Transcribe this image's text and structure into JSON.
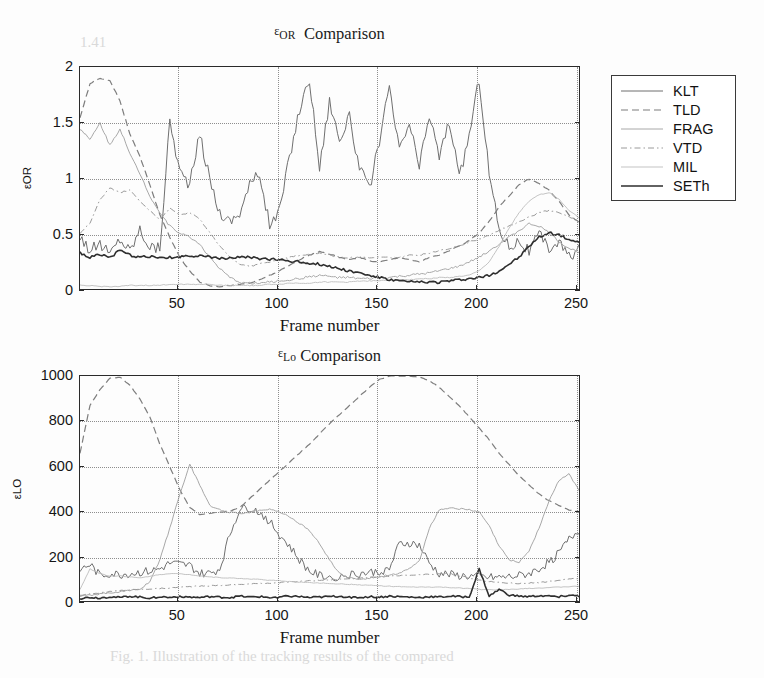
{
  "figures": [
    {
      "id": "top",
      "title_eps": "ε",
      "title_sub": "OR",
      "title_rest": "Comparison",
      "ylabel_eps": "ε",
      "ylabel_sub": "OR",
      "xlabel": "Frame number",
      "yticks": [
        "0",
        "0.5",
        "1",
        "1.5",
        "2"
      ],
      "xticks": [
        "50",
        "100",
        "150",
        "200",
        "250"
      ]
    },
    {
      "id": "bottom",
      "title_eps": "ε",
      "title_sub": "Lo",
      "title_rest": "Comparison",
      "ylabel_eps": "ε",
      "ylabel_sub": "LO",
      "xlabel": "Frame number",
      "yticks": [
        "0",
        "200",
        "400",
        "600",
        "800",
        "1000"
      ],
      "xticks": [
        "50",
        "100",
        "150",
        "200",
        "250"
      ]
    }
  ],
  "legend": {
    "entries": [
      {
        "label": "KLT",
        "color": "#6f6f6f",
        "width": 1.0,
        "dash": "none"
      },
      {
        "label": "TLD",
        "color": "#7d7d7d",
        "width": 1.2,
        "dash": "7,4"
      },
      {
        "label": "FRAG",
        "color": "#a8a8a8",
        "width": 1.0,
        "dash": "none"
      },
      {
        "label": "VTD",
        "color": "#9a9a9a",
        "width": 1.0,
        "dash": "6,3,1.5,3"
      },
      {
        "label": "MIL",
        "color": "#bcbcbc",
        "width": 0.9,
        "dash": "none"
      },
      {
        "label": "SETh",
        "color": "#2e2e2e",
        "width": 1.6,
        "dash": "none"
      }
    ]
  },
  "bleed_text": [
    {
      "text": "Fig. 1. Illustration of the tracking results of the compared",
      "left": 110,
      "top": 648
    },
    {
      "text": "1.41",
      "left": 80,
      "top": 34
    }
  ],
  "chart_data": [
    {
      "type": "line",
      "title": "ε_OR Comparison",
      "xlabel": "Frame number",
      "ylabel": "ε_OR",
      "xlim": [
        1,
        252
      ],
      "ylim": [
        0,
        2
      ],
      "grid": true,
      "legend_position": "outside-right",
      "x": [
        1,
        6,
        11,
        16,
        21,
        26,
        31,
        36,
        41,
        46,
        51,
        56,
        61,
        66,
        71,
        76,
        81,
        86,
        91,
        96,
        101,
        106,
        111,
        116,
        121,
        126,
        131,
        136,
        141,
        146,
        151,
        156,
        161,
        166,
        171,
        176,
        181,
        186,
        191,
        196,
        201,
        206,
        211,
        216,
        221,
        226,
        231,
        236,
        241,
        246,
        252
      ],
      "series": [
        {
          "name": "KLT",
          "values": [
            0.5,
            0.36,
            0.42,
            0.33,
            0.47,
            0.36,
            0.55,
            0.4,
            0.38,
            1.52,
            1.07,
            0.95,
            1.4,
            1.0,
            0.7,
            0.62,
            0.7,
            0.95,
            1.05,
            0.58,
            0.72,
            1.2,
            1.62,
            1.9,
            1.1,
            1.7,
            1.35,
            1.55,
            1.1,
            0.9,
            1.35,
            1.8,
            1.25,
            1.5,
            1.1,
            1.58,
            1.2,
            1.52,
            1.0,
            1.4,
            1.9,
            1.05,
            0.55,
            0.4,
            0.45,
            0.35,
            0.5,
            0.38,
            0.44,
            0.3,
            0.4
          ]
        },
        {
          "name": "TLD",
          "values": [
            1.55,
            1.85,
            1.9,
            1.88,
            1.7,
            1.4,
            1.2,
            0.95,
            0.68,
            0.48,
            0.3,
            0.18,
            0.08,
            0.05,
            0.04,
            0.05,
            0.06,
            0.07,
            0.1,
            0.14,
            0.18,
            0.23,
            0.28,
            0.32,
            0.35,
            0.33,
            0.3,
            0.28,
            0.3,
            0.27,
            0.26,
            0.28,
            0.3,
            0.28,
            0.26,
            0.3,
            0.32,
            0.36,
            0.4,
            0.45,
            0.52,
            0.62,
            0.75,
            0.85,
            0.95,
            1.0,
            0.96,
            0.9,
            0.8,
            0.68,
            0.6
          ]
        },
        {
          "name": "FRAG",
          "values": [
            1.45,
            1.35,
            1.5,
            1.3,
            1.45,
            1.22,
            1.05,
            0.85,
            0.7,
            0.58,
            0.52,
            0.48,
            0.42,
            0.3,
            0.2,
            0.12,
            0.08,
            0.07,
            0.07,
            0.08,
            0.09,
            0.1,
            0.11,
            0.13,
            0.14,
            0.13,
            0.12,
            0.12,
            0.11,
            0.11,
            0.12,
            0.12,
            0.13,
            0.14,
            0.15,
            0.16,
            0.18,
            0.2,
            0.22,
            0.26,
            0.3,
            0.36,
            0.42,
            0.48,
            0.54,
            0.6,
            0.58,
            0.52,
            0.44,
            0.38,
            0.34
          ]
        },
        {
          "name": "VTD",
          "values": [
            0.52,
            0.6,
            0.82,
            0.92,
            0.88,
            0.9,
            0.8,
            0.72,
            0.64,
            0.74,
            0.68,
            0.7,
            0.64,
            0.52,
            0.4,
            0.3,
            0.24,
            0.22,
            0.24,
            0.26,
            0.28,
            0.3,
            0.32,
            0.33,
            0.34,
            0.32,
            0.3,
            0.3,
            0.3,
            0.3,
            0.3,
            0.3,
            0.3,
            0.32,
            0.32,
            0.34,
            0.36,
            0.38,
            0.4,
            0.44,
            0.46,
            0.5,
            0.54,
            0.58,
            0.62,
            0.66,
            0.7,
            0.72,
            0.7,
            0.66,
            0.62
          ]
        },
        {
          "name": "MIL",
          "values": [
            0.05,
            0.05,
            0.04,
            0.04,
            0.04,
            0.05,
            0.05,
            0.05,
            0.05,
            0.06,
            0.06,
            0.06,
            0.06,
            0.06,
            0.05,
            0.05,
            0.05,
            0.05,
            0.05,
            0.06,
            0.06,
            0.07,
            0.07,
            0.07,
            0.08,
            0.08,
            0.08,
            0.08,
            0.09,
            0.09,
            0.09,
            0.1,
            0.1,
            0.1,
            0.11,
            0.11,
            0.12,
            0.12,
            0.13,
            0.14,
            0.18,
            0.26,
            0.4,
            0.56,
            0.7,
            0.8,
            0.86,
            0.88,
            0.82,
            0.72,
            0.64
          ]
        },
        {
          "name": "SETh",
          "values": [
            0.34,
            0.3,
            0.33,
            0.3,
            0.36,
            0.32,
            0.3,
            0.31,
            0.29,
            0.3,
            0.3,
            0.31,
            0.32,
            0.3,
            0.29,
            0.3,
            0.3,
            0.3,
            0.29,
            0.28,
            0.28,
            0.27,
            0.26,
            0.25,
            0.24,
            0.22,
            0.2,
            0.18,
            0.16,
            0.14,
            0.12,
            0.1,
            0.09,
            0.08,
            0.08,
            0.08,
            0.08,
            0.09,
            0.1,
            0.11,
            0.12,
            0.14,
            0.18,
            0.24,
            0.3,
            0.4,
            0.48,
            0.52,
            0.5,
            0.46,
            0.42
          ]
        }
      ]
    },
    {
      "type": "line",
      "title": "ε_Lo Comparison",
      "xlabel": "Frame number",
      "ylabel": "ε_LO",
      "xlim": [
        1,
        252
      ],
      "ylim": [
        0,
        1000
      ],
      "grid": true,
      "legend_position": "outside-right",
      "x": [
        1,
        6,
        11,
        16,
        21,
        26,
        31,
        36,
        41,
        46,
        51,
        56,
        61,
        66,
        71,
        76,
        81,
        86,
        91,
        96,
        101,
        106,
        111,
        116,
        121,
        126,
        131,
        136,
        141,
        146,
        151,
        156,
        161,
        166,
        171,
        176,
        181,
        186,
        191,
        196,
        201,
        206,
        211,
        216,
        221,
        226,
        231,
        236,
        241,
        246,
        252
      ],
      "series": [
        {
          "name": "KLT",
          "values": [
            145,
            170,
            120,
            130,
            125,
            130,
            135,
            140,
            150,
            175,
            170,
            165,
            130,
            130,
            150,
            300,
            415,
            420,
            400,
            360,
            300,
            250,
            190,
            140,
            120,
            115,
            118,
            125,
            130,
            135,
            140,
            150,
            260,
            265,
            255,
            175,
            130,
            125,
            120,
            118,
            115,
            112,
            112,
            115,
            120,
            130,
            150,
            180,
            220,
            280,
            330
          ]
        },
        {
          "name": "TLD",
          "values": [
            660,
            870,
            940,
            990,
            995,
            960,
            900,
            820,
            700,
            600,
            500,
            420,
            390,
            395,
            400,
            405,
            420,
            460,
            500,
            540,
            580,
            620,
            660,
            700,
            745,
            790,
            830,
            870,
            910,
            950,
            985,
            1000,
            1000,
            1000,
            995,
            980,
            950,
            910,
            870,
            820,
            770,
            720,
            660,
            610,
            560,
            520,
            480,
            450,
            430,
            410,
            400
          ]
        },
        {
          "name": "FRAG",
          "values": [
            30,
            35,
            40,
            45,
            50,
            55,
            60,
            95,
            190,
            330,
            480,
            610,
            520,
            430,
            410,
            400,
            395,
            400,
            410,
            415,
            400,
            380,
            350,
            320,
            260,
            190,
            130,
            110,
            105,
            110,
            115,
            125,
            130,
            150,
            185,
            330,
            410,
            420,
            415,
            410,
            400,
            340,
            250,
            190,
            180,
            230,
            330,
            450,
            540,
            570,
            480
          ]
        },
        {
          "name": "VTD",
          "values": [
            35,
            40,
            45,
            50,
            55,
            58,
            60,
            62,
            64,
            66,
            70,
            72,
            74,
            76,
            78,
            80,
            82,
            84,
            86,
            88,
            90,
            92,
            95,
            98,
            100,
            103,
            105,
            108,
            110,
            112,
            115,
            118,
            120,
            122,
            124,
            126,
            128,
            130,
            120,
            110,
            100,
            95,
            90,
            88,
            86,
            88,
            90,
            95,
            100,
            105,
            110
          ]
        },
        {
          "name": "MIL",
          "values": [
            60,
            150,
            130,
            118,
            120,
            115,
            110,
            118,
            125,
            130,
            128,
            125,
            120,
            115,
            112,
            110,
            108,
            106,
            104,
            100,
            98,
            95,
            92,
            90,
            88,
            86,
            84,
            82,
            80,
            78,
            76,
            74,
            72,
            70,
            70,
            70,
            70,
            68,
            66,
            64,
            60,
            58,
            58,
            60,
            62,
            64,
            66,
            68,
            70,
            72,
            74
          ]
        },
        {
          "name": "SETh",
          "values": [
            20,
            25,
            22,
            28,
            24,
            30,
            26,
            22,
            28,
            24,
            30,
            26,
            24,
            28,
            26,
            24,
            30,
            26,
            28,
            24,
            26,
            30,
            28,
            24,
            26,
            28,
            30,
            26,
            24,
            28,
            26,
            30,
            28,
            26,
            24,
            28,
            26,
            30,
            28,
            26,
            150,
            30,
            60,
            35,
            30,
            28,
            32,
            30,
            28,
            34,
            30
          ]
        }
      ]
    }
  ]
}
